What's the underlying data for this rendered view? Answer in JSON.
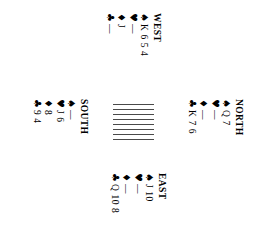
{
  "diagram": {
    "type": "bridge-hand-diagram",
    "rotation_degrees": 90,
    "suit_pips": {
      "spade": "♠",
      "heart": "♥",
      "diamond": "♦",
      "club": "♣"
    },
    "void_marker": "—",
    "center": {
      "hatch_line_count": 8
    },
    "hands": {
      "north": {
        "label": "NORTH",
        "suits": [
          {
            "suit": "spade",
            "pip": "♠",
            "cards": "Q 7"
          },
          {
            "suit": "heart",
            "pip": "♥",
            "cards": "—"
          },
          {
            "suit": "diamond",
            "pip": "♦",
            "cards": "—"
          },
          {
            "suit": "club",
            "pip": "♣",
            "cards": "K 7 6"
          }
        ]
      },
      "west": {
        "label": "WEST",
        "suits": [
          {
            "suit": "spade",
            "pip": "♠",
            "cards": "K 6 5 4"
          },
          {
            "suit": "heart",
            "pip": "♥",
            "cards": "—"
          },
          {
            "suit": "diamond",
            "pip": "♦",
            "cards": "J"
          },
          {
            "suit": "club",
            "pip": "♣",
            "cards": "—"
          }
        ]
      },
      "east": {
        "label": "EAST",
        "suits": [
          {
            "suit": "spade",
            "pip": "♠",
            "cards": "J 10"
          },
          {
            "suit": "heart",
            "pip": "♥",
            "cards": "—"
          },
          {
            "suit": "diamond",
            "pip": "♦",
            "cards": "—"
          },
          {
            "suit": "club",
            "pip": "♣",
            "cards": "Q 10 8"
          }
        ]
      },
      "south": {
        "label": "SOUTH",
        "suits": [
          {
            "suit": "spade",
            "pip": "♠",
            "cards": "—"
          },
          {
            "suit": "heart",
            "pip": "♥",
            "cards": "J 6"
          },
          {
            "suit": "diamond",
            "pip": "♦",
            "cards": "8"
          },
          {
            "suit": "club",
            "pip": "♣",
            "cards": "9 4"
          }
        ]
      }
    }
  }
}
